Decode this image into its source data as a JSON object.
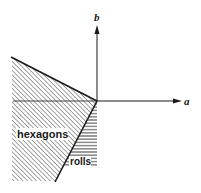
{
  "diagram": {
    "type": "phase diagram",
    "axes": {
      "x_label": "a",
      "y_label": "b"
    },
    "regions": [
      {
        "id": "hexagons",
        "label": "hexagons",
        "hatch": "diagonal"
      },
      {
        "id": "rolls",
        "label": "rolls",
        "hatch": "horizontal"
      }
    ],
    "colors": {
      "ink": "#1a1a1a",
      "background": "#ffffff"
    }
  }
}
